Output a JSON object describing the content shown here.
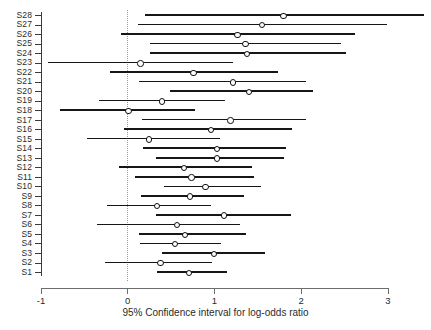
{
  "chart_data": {
    "type": "scatter",
    "subtype": "forest-plot",
    "title": "",
    "xlabel": "95% Confidence interval for log-odds ratio",
    "ylabel": "",
    "xlim": [
      -1,
      3
    ],
    "ylim_categories_count": 28,
    "xticks": [
      -1,
      0,
      1,
      2,
      3
    ],
    "xtick_labels": [
      "-1",
      "0",
      "1",
      "2",
      "3"
    ],
    "grid": false,
    "legend": null,
    "reference_line": {
      "x": 0,
      "style": "dotted",
      "color": "#9a9a9a"
    },
    "marker": {
      "shape": "circle-open",
      "color": "#111111"
    },
    "interval_color": "#161616",
    "categories": [
      "S28",
      "S27",
      "S26",
      "S25",
      "S24",
      "S23",
      "S22",
      "S21",
      "S20",
      "S19",
      "S18",
      "S17",
      "S16",
      "S15",
      "S14",
      "S13",
      "S12",
      "S11",
      "S10",
      "S9",
      "S8",
      "S7",
      "S6",
      "S5",
      "S4",
      "S3",
      "S2",
      "S1"
    ],
    "points": [
      {
        "label": "S28",
        "estimate": 1.8,
        "low": 0.2,
        "high": 3.42
      },
      {
        "label": "S27",
        "estimate": 1.55,
        "low": 0.12,
        "high": 2.99
      },
      {
        "label": "S26",
        "estimate": 1.27,
        "low": -0.08,
        "high": 2.62
      },
      {
        "label": "S25",
        "estimate": 1.36,
        "low": 0.26,
        "high": 2.46
      },
      {
        "label": "S24",
        "estimate": 1.38,
        "low": 0.26,
        "high": 2.52
      },
      {
        "label": "S23",
        "estimate": 0.15,
        "low": -0.92,
        "high": 1.21
      },
      {
        "label": "S22",
        "estimate": 0.76,
        "low": -0.2,
        "high": 1.73
      },
      {
        "label": "S21",
        "estimate": 1.22,
        "low": 0.13,
        "high": 2.05
      },
      {
        "label": "S20",
        "estimate": 1.4,
        "low": 0.49,
        "high": 2.13
      },
      {
        "label": "S19",
        "estimate": 0.4,
        "low": -0.33,
        "high": 1.12
      },
      {
        "label": "S18",
        "estimate": 0.01,
        "low": -0.78,
        "high": 0.77
      },
      {
        "label": "S17",
        "estimate": 1.19,
        "low": 0.16,
        "high": 2.05
      },
      {
        "label": "S16",
        "estimate": 0.96,
        "low": -0.04,
        "high": 1.89
      },
      {
        "label": "S15",
        "estimate": 0.25,
        "low": -0.47,
        "high": 1.06
      },
      {
        "label": "S14",
        "estimate": 1.03,
        "low": 0.17,
        "high": 1.82
      },
      {
        "label": "S13",
        "estimate": 1.03,
        "low": 0.32,
        "high": 1.8
      },
      {
        "label": "S12",
        "estimate": 0.65,
        "low": -0.1,
        "high": 1.43
      },
      {
        "label": "S11",
        "estimate": 0.74,
        "low": 0.08,
        "high": 1.46
      },
      {
        "label": "S10",
        "estimate": 0.9,
        "low": 0.42,
        "high": 1.54
      },
      {
        "label": "S9",
        "estimate": 0.72,
        "low": 0.15,
        "high": 1.34
      },
      {
        "label": "S8",
        "estimate": 0.34,
        "low": -0.24,
        "high": 0.96
      },
      {
        "label": "S7",
        "estimate": 1.11,
        "low": 0.32,
        "high": 1.88
      },
      {
        "label": "S6",
        "estimate": 0.57,
        "low": -0.35,
        "high": 1.29
      },
      {
        "label": "S5",
        "estimate": 0.66,
        "low": 0.13,
        "high": 1.36
      },
      {
        "label": "S4",
        "estimate": 0.55,
        "low": 0.14,
        "high": 1.08
      },
      {
        "label": "S3",
        "estimate": 1.0,
        "low": 0.4,
        "high": 1.58
      },
      {
        "label": "S2",
        "estimate": 0.38,
        "low": -0.26,
        "high": 0.97
      },
      {
        "label": "S1",
        "estimate": 0.71,
        "low": 0.34,
        "high": 1.14
      }
    ]
  },
  "axis": {
    "x_title": "95% Confidence interval for log-odds ratio"
  }
}
